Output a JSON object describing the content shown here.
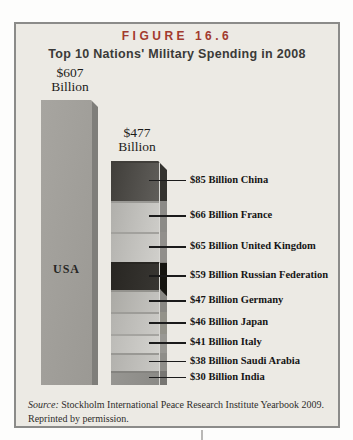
{
  "figure": {
    "label": "FIGURE 16.6",
    "title": "Top 10 Nations' Military Spending in 2008"
  },
  "chart_data": {
    "type": "bar",
    "title": "Top 10 Nations' Military Spending in 2008",
    "unit": "US$ billions",
    "categories": [
      "USA",
      "China",
      "France",
      "United Kingdom",
      "Russian Federation",
      "Germany",
      "Japan",
      "Italy",
      "Saudi Arabia",
      "India"
    ],
    "values": [
      607,
      85,
      66,
      65,
      59,
      47,
      46,
      41,
      38,
      30
    ],
    "usa_bar": {
      "bar_label": "USA",
      "total": 607,
      "annotation": {
        "value": "$607",
        "unit": "Billion"
      }
    },
    "stacked_bar": {
      "total": 477,
      "annotation": {
        "value": "$477",
        "unit": "Billion"
      },
      "segments": [
        {
          "country": "China",
          "value": 85,
          "callout": "$85 Billion China",
          "front_from": "#403e3a",
          "front_to": "#605e5a",
          "edge": "#403e3a",
          "side": "#34332f"
        },
        {
          "country": "France",
          "value": 66,
          "callout": "$66 Billion France",
          "front_from": "#b0afab",
          "front_to": "#cdccc8",
          "edge": "#9a9995",
          "side": "#8c8b87"
        },
        {
          "country": "United Kingdom",
          "value": 65,
          "callout": "$65 Billion United Kingdom",
          "front_from": "#b5b4b0",
          "front_to": "#d0cfcb",
          "edge": "#a2a19d",
          "side": "#918f8b"
        },
        {
          "country": "Russian Federation",
          "value": 59,
          "callout": "$59 Billion Russian Federation",
          "front_from": "#282622",
          "front_to": "#383632",
          "edge": "#282622",
          "side": "#161510",
          "side_overhang": 6
        },
        {
          "country": "Germany",
          "value": 47,
          "callout": "$47 Billion Germany",
          "front_from": "#abaaa5",
          "front_to": "#c5c4c0",
          "edge": "#93928d",
          "side": "#898883"
        },
        {
          "country": "Japan",
          "value": 46,
          "callout": "$46 Billion Japan",
          "front_from": "#b4b3af",
          "front_to": "#cbcac6",
          "edge": "#9d9c98",
          "side": "#939289"
        },
        {
          "country": "Italy",
          "value": 41,
          "callout": "$41 Billion Italy",
          "front_from": "#bcbbb7",
          "front_to": "#d3d2ce",
          "edge": "#a5a4a0",
          "side": "#999893"
        },
        {
          "country": "Saudi Arabia",
          "value": 38,
          "callout": "$38 Billion Saudi Arabia",
          "front_from": "#b2b1ad",
          "front_to": "#c9c8c4",
          "edge": "#999894",
          "side": "#8f8e89"
        },
        {
          "country": "India",
          "value": 30,
          "callout": "$30 Billion India",
          "front_from": "#979692",
          "front_to": "#8b8a86",
          "edge": "#84837f",
          "side": "#777672"
        }
      ]
    }
  },
  "source": {
    "prefix": "Source:",
    "text": "Stockholm International Peace Research Institute Yearbook 2009.",
    "line2": "Reprinted by permission."
  },
  "colors": {
    "figure_label": "#a23a2e",
    "title_text": "#3b3a38",
    "box_bg": "#eceae4",
    "box_border": "#8b8b89",
    "usa_front": "#a19f9a",
    "usa_side": "#7f7e7a",
    "callout_line": "#1b1b1b"
  }
}
